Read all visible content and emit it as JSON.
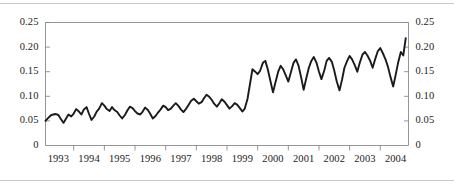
{
  "figure": {
    "background_color": "#ffffff",
    "line_color": "#1a1a1a",
    "axis_color": "#8a8a8a",
    "rule_color": "#c9c9c9"
  },
  "chart_data": {
    "type": "line",
    "title": "",
    "subtitle": "",
    "xlabel": "",
    "ylabel": "",
    "xlim": [
      1992.58,
      2004.42
    ],
    "ylim": [
      0,
      0.25
    ],
    "grid": false,
    "legend": null,
    "y_left_ticks": [
      "0",
      "0.05",
      "0.10",
      "0.15",
      "0.20",
      "0.25"
    ],
    "y_left_tick_values": [
      0,
      0.05,
      0.1,
      0.15,
      0.2,
      0.25
    ],
    "y_right_ticks": [
      "0",
      "0.05",
      "0.10",
      "0.15",
      "0.20",
      "0.25"
    ],
    "y_right_tick_values": [
      0,
      0.05,
      0.1,
      0.15,
      0.2,
      0.25
    ],
    "x_ticks": [
      "1993",
      "1994",
      "1995",
      "1996",
      "1997",
      "1998",
      "1999",
      "2000",
      "2001",
      "2002",
      "2003",
      "2004"
    ],
    "x_tick_values": [
      1993,
      1994,
      1995,
      1996,
      1997,
      1998,
      1999,
      2000,
      2001,
      2002,
      2003,
      2004
    ],
    "series": [
      {
        "name": "series-1",
        "color": "#1a1a1a",
        "x": [
          1992.58,
          1992.67,
          1992.75,
          1992.83,
          1992.92,
          1993.0,
          1993.08,
          1993.17,
          1993.25,
          1993.33,
          1993.42,
          1993.5,
          1993.58,
          1993.67,
          1993.75,
          1993.83,
          1993.92,
          1994.0,
          1994.08,
          1994.17,
          1994.25,
          1994.33,
          1994.42,
          1994.5,
          1994.58,
          1994.67,
          1994.75,
          1994.83,
          1994.92,
          1995.0,
          1995.08,
          1995.17,
          1995.25,
          1995.33,
          1995.42,
          1995.5,
          1995.58,
          1995.67,
          1995.75,
          1995.83,
          1995.92,
          1996.0,
          1996.08,
          1996.17,
          1996.25,
          1996.33,
          1996.42,
          1996.5,
          1996.58,
          1996.67,
          1996.75,
          1996.83,
          1996.92,
          1997.0,
          1997.08,
          1997.17,
          1997.25,
          1997.33,
          1997.42,
          1997.5,
          1997.58,
          1997.67,
          1997.75,
          1997.83,
          1997.92,
          1998.0,
          1998.08,
          1998.17,
          1998.25,
          1998.33,
          1998.42,
          1998.5,
          1998.58,
          1998.67,
          1998.75,
          1998.83,
          1998.92,
          1999.0,
          1999.08,
          1999.17,
          1999.25,
          1999.33,
          1999.42,
          1999.5,
          1999.58,
          1999.67,
          1999.75,
          1999.83,
          1999.92,
          2000.0,
          2000.08,
          2000.17,
          2000.25,
          2000.33,
          2000.42,
          2000.5,
          2000.58,
          2000.67,
          2000.75,
          2000.83,
          2000.92,
          2001.0,
          2001.08,
          2001.17,
          2001.25,
          2001.33,
          2001.42,
          2001.5,
          2001.58,
          2001.67,
          2001.75,
          2001.83,
          2001.92,
          2002.0,
          2002.08,
          2002.17,
          2002.25,
          2002.33,
          2002.42,
          2002.5,
          2002.58,
          2002.67,
          2002.75,
          2002.83,
          2002.92,
          2003.0,
          2003.08,
          2003.17,
          2003.25,
          2003.33,
          2003.42,
          2003.5,
          2003.58,
          2003.67,
          2003.75,
          2003.83,
          2003.92,
          2004.0,
          2004.08,
          2004.17,
          2004.25,
          2004.33
        ],
        "y": [
          0.05,
          0.056,
          0.061,
          0.063,
          0.064,
          0.062,
          0.054,
          0.046,
          0.055,
          0.063,
          0.059,
          0.065,
          0.074,
          0.069,
          0.063,
          0.073,
          0.078,
          0.064,
          0.052,
          0.059,
          0.069,
          0.075,
          0.086,
          0.081,
          0.074,
          0.07,
          0.078,
          0.072,
          0.068,
          0.061,
          0.055,
          0.062,
          0.071,
          0.079,
          0.076,
          0.07,
          0.065,
          0.063,
          0.069,
          0.077,
          0.072,
          0.064,
          0.055,
          0.06,
          0.067,
          0.073,
          0.081,
          0.078,
          0.072,
          0.075,
          0.081,
          0.086,
          0.08,
          0.073,
          0.068,
          0.075,
          0.083,
          0.091,
          0.095,
          0.09,
          0.085,
          0.088,
          0.096,
          0.103,
          0.099,
          0.093,
          0.085,
          0.079,
          0.086,
          0.094,
          0.089,
          0.082,
          0.075,
          0.08,
          0.086,
          0.083,
          0.076,
          0.069,
          0.075,
          0.095,
          0.125,
          0.155,
          0.15,
          0.145,
          0.152,
          0.168,
          0.172,
          0.155,
          0.13,
          0.108,
          0.128,
          0.15,
          0.162,
          0.155,
          0.142,
          0.13,
          0.148,
          0.168,
          0.175,
          0.163,
          0.138,
          0.113,
          0.135,
          0.158,
          0.172,
          0.18,
          0.168,
          0.15,
          0.135,
          0.152,
          0.172,
          0.178,
          0.17,
          0.152,
          0.13,
          0.112,
          0.133,
          0.158,
          0.172,
          0.182,
          0.175,
          0.163,
          0.15,
          0.168,
          0.185,
          0.19,
          0.183,
          0.172,
          0.158,
          0.175,
          0.192,
          0.198,
          0.188,
          0.175,
          0.16,
          0.14,
          0.12,
          0.143,
          0.168,
          0.19,
          0.183,
          0.218
        ]
      }
    ]
  }
}
